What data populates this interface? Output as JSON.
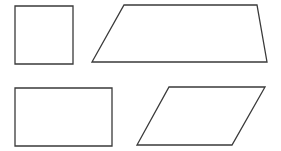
{
  "canvas": {
    "width": 281,
    "height": 151,
    "background": "#ffffff"
  },
  "style": {
    "stroke_color": "#3a3a3a"
  },
  "shapes": [
    {
      "name": "square",
      "type": "polygon",
      "points": "15,6 73,6 73,64 15,64"
    },
    {
      "name": "trapezoid",
      "type": "polygon",
      "points": "124,5 257,5 267,62 92,62"
    },
    {
      "name": "rectangle",
      "type": "polygon",
      "points": "15,88 112,88 112,146 15,146"
    },
    {
      "name": "parallelogram",
      "type": "polygon",
      "points": "169,87 265,87 232,145 137,145"
    }
  ]
}
